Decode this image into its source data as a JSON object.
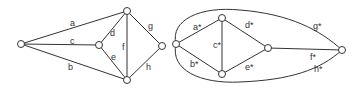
{
  "graph_left": {
    "nodes": [
      {
        "id": "u",
        "x": 21,
        "y": 44
      },
      {
        "id": "t",
        "x": 127,
        "y": 11
      },
      {
        "id": "m",
        "x": 99,
        "y": 45
      },
      {
        "id": "r",
        "x": 162,
        "y": 46
      },
      {
        "id": "b",
        "x": 127,
        "y": 80
      }
    ],
    "edges": [
      {
        "label": "a",
        "from": "u",
        "to": "t",
        "lx": 70,
        "ly": 26
      },
      {
        "label": "c",
        "from": "u",
        "to": "m",
        "lx": 70,
        "ly": 44
      },
      {
        "label": "b",
        "from": "u",
        "to": "b",
        "lx": 68,
        "ly": 70
      },
      {
        "label": "d",
        "from": "m",
        "to": "t",
        "lx": 110,
        "ly": 36
      },
      {
        "label": "e",
        "from": "m",
        "to": "b",
        "lx": 111,
        "ly": 60
      },
      {
        "label": "f",
        "from": "t",
        "to": "b",
        "lx": 122,
        "ly": 50
      },
      {
        "label": "g",
        "from": "t",
        "to": "r",
        "lx": 148,
        "ly": 29
      },
      {
        "label": "h",
        "from": "r",
        "to": "b",
        "lx": 146,
        "ly": 70
      }
    ]
  },
  "graph_right": {
    "nodes": [
      {
        "id": "l",
        "x": 176,
        "y": 44
      },
      {
        "id": "t",
        "x": 222,
        "y": 18
      },
      {
        "id": "b",
        "x": 222,
        "y": 74
      },
      {
        "id": "m",
        "x": 268,
        "y": 48
      },
      {
        "id": "r",
        "x": 342,
        "y": 50
      }
    ],
    "labels": [
      {
        "text": "a*",
        "x": 193,
        "y": 30
      },
      {
        "text": "b*",
        "x": 190,
        "y": 67
      },
      {
        "text": "c*",
        "x": 213,
        "y": 48
      },
      {
        "text": "d*",
        "x": 245,
        "y": 28
      },
      {
        "text": "e*",
        "x": 245,
        "y": 70
      },
      {
        "text": "f*",
        "x": 310,
        "y": 60
      },
      {
        "text": "g*",
        "x": 313,
        "y": 29
      },
      {
        "text": "h*",
        "x": 314,
        "y": 72
      }
    ]
  }
}
